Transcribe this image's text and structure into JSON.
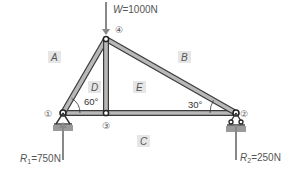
{
  "diagram": {
    "type": "truss",
    "load": {
      "label": "W=1000N",
      "symbol": "W",
      "value": "=1000N"
    },
    "reactions": [
      {
        "symbol": "R",
        "sub": "1",
        "value": "=750N"
      },
      {
        "symbol": "R",
        "sub": "2",
        "value": "=250N"
      }
    ],
    "nodes": [
      {
        "id": "1",
        "label": "①"
      },
      {
        "id": "2",
        "label": "②"
      },
      {
        "id": "3",
        "label": "③"
      },
      {
        "id": "4",
        "label": "④"
      }
    ],
    "regions": [
      "A",
      "B",
      "C",
      "D",
      "E"
    ],
    "angles": [
      {
        "at": "node-1",
        "label": "60°"
      },
      {
        "at": "node-2",
        "label": "30°"
      }
    ],
    "colors": {
      "member_fill": "#b8b8b8",
      "member_edge": "#3a3a3a",
      "arrow": "#888888",
      "support": "#9a9a9a",
      "label_bg": "#e6e6e6",
      "text": "#555555"
    }
  }
}
